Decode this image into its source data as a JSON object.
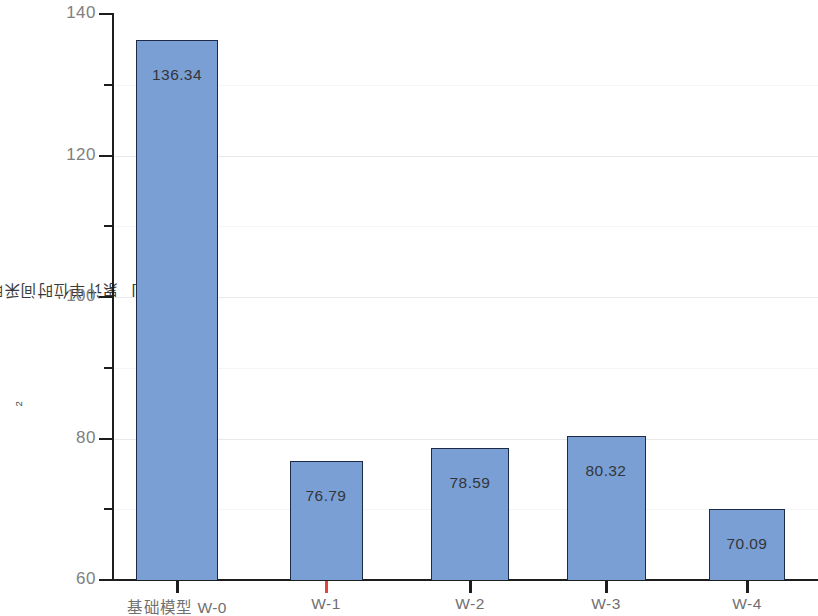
{
  "chart_data": {
    "type": "bar",
    "title": "",
    "xlabel": "",
    "ylabel": "累计单位时间采暖能耗 [kWh/(m²·a)]",
    "ylabel_parts": {
      "prefix": "累计单位时间采暖能耗 [kWh/(m",
      "exponent": "2",
      "suffix": "·a)]"
    },
    "categories": [
      "基础模型 W-0",
      "W-1",
      "W-2",
      "W-3",
      "W-4"
    ],
    "values": [
      136.34,
      76.79,
      78.59,
      80.32,
      70.09
    ],
    "value_labels": [
      "136.34",
      "76.79",
      "78.59",
      "80.32",
      "70.09"
    ],
    "ylim": [
      60,
      140
    ],
    "y_major_ticks": [
      60,
      80,
      100,
      120,
      140
    ],
    "y_major_tick_labels": [
      "60",
      "80",
      "100",
      "120",
      "140"
    ],
    "y_minor_ticks": [
      70,
      90,
      110,
      130
    ],
    "grid": true,
    "legend": false,
    "bar_color": "#7a9fd4",
    "bar_border_color": "#1c2a45",
    "axis_color": "#1d1d1d",
    "tick_label_color": "#808080",
    "value_label_color": "#34353a",
    "grid_color": "#e9e9ec",
    "accent_color": "#e8403a",
    "background_color": "#ffffff"
  }
}
